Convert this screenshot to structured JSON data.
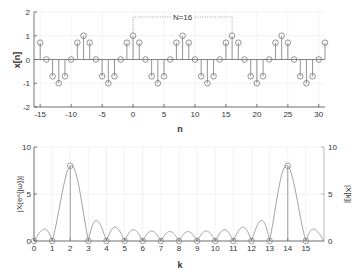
{
  "chart_data": [
    {
      "type": "stem",
      "title": "",
      "xlabel": "n",
      "ylabel": "x[n]",
      "xlim": [
        -16,
        31
      ],
      "ylim": [
        -2,
        2
      ],
      "xticks": [
        -15,
        -10,
        -5,
        0,
        5,
        10,
        15,
        20,
        25,
        30
      ],
      "yticks": [
        -2,
        -1,
        0,
        1,
        2
      ],
      "grid": true,
      "signal": "cos(2*pi*2*n/16)",
      "n_start": -15,
      "n_end": 31,
      "values_one_period": [
        1,
        0.707,
        0,
        -0.707,
        -1,
        -0.707,
        0,
        0.707,
        1,
        0.707,
        0,
        -0.707,
        -1,
        -0.707,
        0,
        0.707
      ],
      "annotation": {
        "text": "N=16",
        "from_n": 0,
        "to_n": 16
      }
    },
    {
      "type": "line+stem",
      "title": "",
      "xlabel": "k",
      "ylabel_left": "|X(e^{jω})|",
      "ylabel_right": "|X[k]|",
      "xlim": [
        0,
        16
      ],
      "ylim": [
        0,
        10
      ],
      "xticks": [
        0,
        1,
        2,
        3,
        4,
        5,
        6,
        7,
        8,
        9,
        10,
        11,
        12,
        13,
        14,
        15
      ],
      "yticks": [
        0,
        5,
        10
      ],
      "grid": true,
      "N": 16,
      "dft_k": [
        0,
        1,
        2,
        3,
        4,
        5,
        6,
        7,
        8,
        9,
        10,
        11,
        12,
        13,
        14,
        15
      ],
      "dft_values": [
        0,
        0,
        8,
        0,
        0,
        0,
        0,
        0,
        0,
        0,
        0,
        0,
        0,
        0,
        8,
        0
      ]
    }
  ]
}
